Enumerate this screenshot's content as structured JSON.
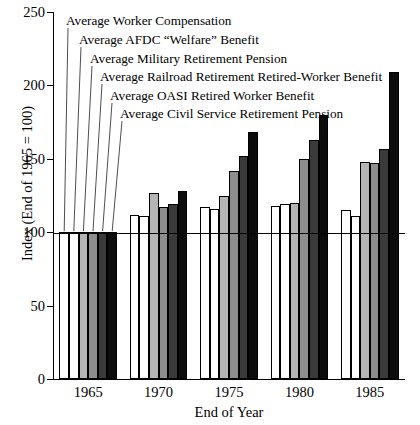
{
  "chart_data": {
    "type": "bar",
    "title": "",
    "xlabel": "End of Year",
    "ylabel": "Index (End of 1965 = 100)",
    "ylim": [
      0,
      250
    ],
    "yticks": [
      0,
      50,
      100,
      150,
      200,
      250
    ],
    "ytick_labels": [
      "0",
      "50",
      "100",
      "150",
      "200",
      "250"
    ],
    "categories": [
      "1965",
      "1970",
      "1975",
      "1980",
      "1985"
    ],
    "grid": false,
    "legend_position": "callout-lines-top-left",
    "reference_line": 100,
    "series": [
      {
        "name": "Average Worker Compensation",
        "fill": "#ffffff",
        "values": [
          100,
          112,
          117,
          118,
          115
        ]
      },
      {
        "name": "Average AFDC “Welfare” Benefit",
        "fill": "#ffffff",
        "values": [
          100,
          111,
          116,
          119,
          111
        ]
      },
      {
        "name": "Average Military Retirement Pension",
        "fill": "#b5b5b5",
        "values": [
          100,
          127,
          125,
          120,
          148
        ]
      },
      {
        "name": "Average Railroad Retirement Retired-Worker Benefit",
        "fill": "#8e8e8e",
        "values": [
          100,
          117,
          142,
          150,
          147
        ]
      },
      {
        "name": "Average OASI Retired Worker Benefit",
        "fill": "#3a3a3a",
        "values": [
          100,
          119,
          152,
          163,
          157
        ]
      },
      {
        "name": "Average Civil Service Retirement Pension",
        "fill": "#0c0c0c",
        "values": [
          100,
          128,
          168,
          180,
          209
        ]
      }
    ]
  },
  "callouts": [
    {
      "label": "Average Worker Compensation"
    },
    {
      "label": "Average AFDC “Welfare” Benefit"
    },
    {
      "label": "Average Military Retirement Pension"
    },
    {
      "label": "Average Railroad Retirement Retired-Worker Benefit"
    },
    {
      "label": "Average OASI Retired Worker Benefit"
    },
    {
      "label": "Average Civil Service Retirement Pension"
    }
  ]
}
